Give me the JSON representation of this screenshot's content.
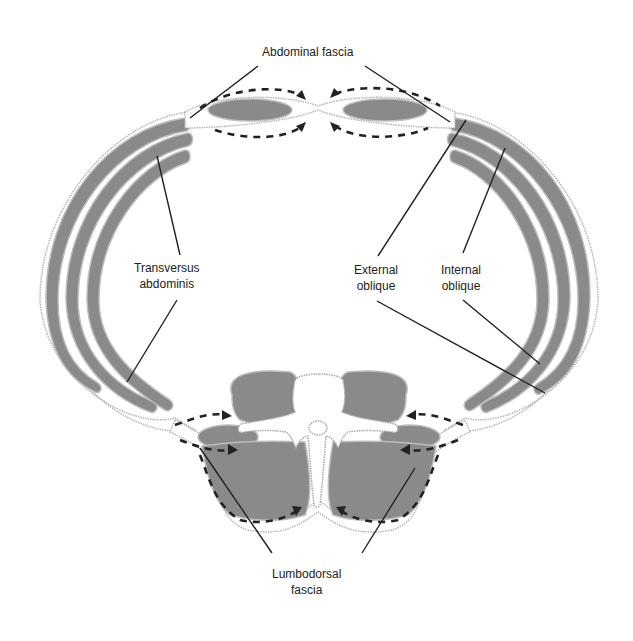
{
  "figure": {
    "colors": {
      "muscle_fill": "#8a8a8a",
      "outline": "#b5b5b5",
      "line": "#222222",
      "background": "#ffffff"
    }
  },
  "labels": {
    "abdominal_fascia": "Abdominal fascia",
    "transversus_line1": "Transversus",
    "transversus_line2": "abdominis",
    "external_line1": "External",
    "external_line2": "oblique",
    "internal_line1": "Internal",
    "internal_line2": "oblique",
    "lumbodorsal_line1": "Lumbodorsal",
    "lumbodorsal_line2": "fascia"
  }
}
